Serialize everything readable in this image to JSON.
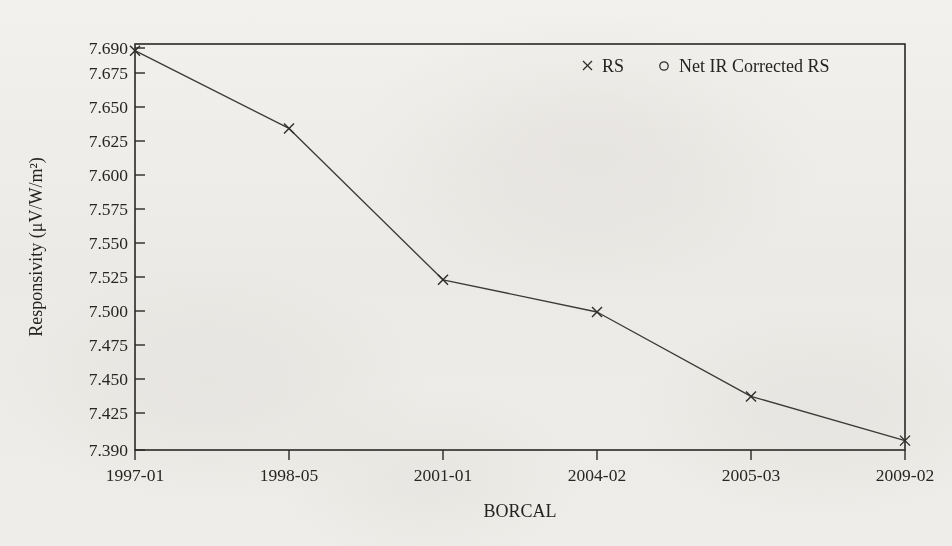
{
  "chart_data": {
    "type": "line",
    "title": "",
    "xlabel": "BORCAL",
    "ylabel": "Responsivity (μV/W/m²)",
    "categories": [
      "1997-01",
      "1998-05",
      "2001-01",
      "2004-02",
      "2005-03",
      "2009-02"
    ],
    "series": [
      {
        "name": "RS",
        "marker": "x",
        "values": [
          7.688,
          7.63,
          7.517,
          7.493,
          7.43,
          7.397
        ]
      },
      {
        "name": "Net IR Corrected RS",
        "marker": "circle",
        "values": [
          7.688,
          7.63,
          7.517,
          7.493,
          7.43,
          7.397
        ]
      }
    ],
    "ylim": [
      7.39,
      7.69
    ],
    "yticks": [
      "7.390",
      "7.425",
      "7.450",
      "7.475",
      "7.500",
      "7.525",
      "7.550",
      "7.575",
      "7.600",
      "7.625",
      "7.650",
      "7.675",
      "7.690"
    ],
    "ytick_values": [
      7.39,
      7.425,
      7.45,
      7.475,
      7.5,
      7.525,
      7.55,
      7.575,
      7.6,
      7.625,
      7.65,
      7.675,
      7.69
    ],
    "xticks": [
      "1997-01",
      "1998-05",
      "2001-01",
      "2004-02",
      "2005-03",
      "2009-02"
    ],
    "grid": false,
    "legend_position": "top-right",
    "legend": [
      {
        "label": "RS",
        "marker": "x"
      },
      {
        "label": "Net IR Corrected RS",
        "marker": "circle"
      }
    ],
    "colors": {
      "line": "#3b3a36",
      "axis": "#2a2926",
      "text": "#242320",
      "background": "#f7f6f4"
    }
  },
  "figure": {
    "width": 952,
    "height": 546,
    "plot_left": 135,
    "plot_right": 905,
    "plot_top": 44,
    "plot_bottom": 450
  }
}
